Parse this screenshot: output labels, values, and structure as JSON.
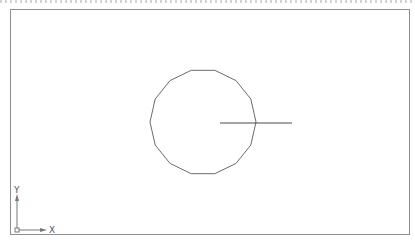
{
  "viewport": {
    "border_color": "#8e8e8e",
    "background": "#ffffff"
  },
  "drawing": {
    "polygon": {
      "sides": 14,
      "center_x": 203,
      "center_y": 122,
      "radius": 53,
      "stroke": "#6b6b6b"
    },
    "line": {
      "x1": 220,
      "y1": 123,
      "x2": 292,
      "y2": 123,
      "stroke": "#4a4a4a"
    }
  },
  "ucs_icon": {
    "x_label": "X",
    "y_label": "Y"
  }
}
